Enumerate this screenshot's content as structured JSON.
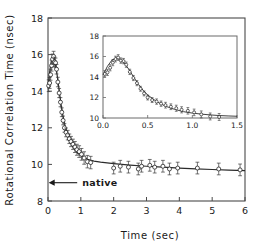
{
  "figure": {
    "background_color": "#ffffff",
    "axis_color": "#4a4a4a",
    "data_color": "#242424",
    "curve_color": "#2b2b2b"
  },
  "chart_data": {
    "type": "scatter",
    "title": "",
    "xlabel": "Time (sec)",
    "ylabel": "Rotational Correlation Time (nsec)",
    "xlim": [
      0,
      6
    ],
    "ylim": [
      8,
      18
    ],
    "xticks": [
      0,
      1,
      2,
      3,
      4,
      5,
      6
    ],
    "yticks": [
      8,
      10,
      12,
      14,
      16,
      18
    ],
    "xtick_labels": [
      "0",
      "1",
      "2",
      "3",
      "4",
      "5",
      "6"
    ],
    "ytick_labels": [
      "8",
      "10",
      "12",
      "14",
      "16",
      "18"
    ],
    "grid": false,
    "legend": "none",
    "annotations": [
      {
        "text": "native",
        "x": 0.95,
        "y": 9.0,
        "arrow_to_x": 0.02,
        "arrow_to_y": 9.0,
        "style": "left-arrow"
      }
    ],
    "series": [
      {
        "name": "Rotational correlation time",
        "marker": "open-circle",
        "errorbars": true,
        "x": [
          0.02,
          0.05,
          0.08,
          0.11,
          0.14,
          0.17,
          0.2,
          0.23,
          0.26,
          0.3,
          0.34,
          0.38,
          0.42,
          0.46,
          0.5,
          0.55,
          0.6,
          0.65,
          0.7,
          0.76,
          0.82,
          0.88,
          0.95,
          1.02,
          1.1,
          1.2,
          1.3,
          2.0,
          2.2,
          2.45,
          2.75,
          2.85,
          3.1,
          3.25,
          3.5,
          3.7,
          3.95,
          4.55,
          5.2,
          5.85
        ],
        "y": [
          14.3,
          14.45,
          14.9,
          15.4,
          15.75,
          15.9,
          15.6,
          15.55,
          15.2,
          14.5,
          13.9,
          13.4,
          12.85,
          12.4,
          12.0,
          11.75,
          11.6,
          11.4,
          11.25,
          11.1,
          10.95,
          10.8,
          10.7,
          10.55,
          10.35,
          10.15,
          10.1,
          9.8,
          9.9,
          9.85,
          9.75,
          9.9,
          9.95,
          9.85,
          9.9,
          9.75,
          9.8,
          9.8,
          9.75,
          9.7
        ],
        "yerr": [
          0.32,
          0.3,
          0.3,
          0.3,
          0.28,
          0.28,
          0.26,
          0.26,
          0.26,
          0.26,
          0.25,
          0.25,
          0.24,
          0.24,
          0.24,
          0.24,
          0.26,
          0.26,
          0.28,
          0.28,
          0.3,
          0.3,
          0.32,
          0.32,
          0.34,
          0.34,
          0.34,
          0.32,
          0.32,
          0.32,
          0.32,
          0.32,
          0.32,
          0.32,
          0.32,
          0.32,
          0.32,
          0.32,
          0.32,
          0.32
        ]
      }
    ],
    "fit_curve": {
      "name": "model fit",
      "x": [
        0.0,
        0.05,
        0.1,
        0.15,
        0.2,
        0.25,
        0.3,
        0.35,
        0.4,
        0.45,
        0.5,
        0.6,
        0.7,
        0.8,
        0.9,
        1.0,
        1.2,
        1.4,
        1.6,
        1.8,
        2.0,
        2.5,
        3.0,
        3.5,
        4.0,
        4.5,
        5.0,
        5.5,
        6.0
      ],
      "y": [
        14.2,
        15.05,
        15.65,
        15.85,
        15.7,
        15.25,
        14.6,
        13.9,
        13.25,
        12.7,
        12.25,
        11.6,
        11.15,
        10.85,
        10.62,
        10.48,
        10.28,
        10.18,
        10.12,
        10.08,
        10.04,
        9.96,
        9.9,
        9.85,
        9.8,
        9.76,
        9.72,
        9.69,
        9.66
      ]
    },
    "inset": {
      "type": "scatter",
      "xlabel": "",
      "ylabel": "",
      "xlim": [
        0.0,
        1.5
      ],
      "ylim": [
        10,
        18
      ],
      "xticks": [
        0.0,
        0.5,
        1.0,
        1.5
      ],
      "yticks": [
        10,
        12,
        14,
        16,
        18
      ],
      "xtick_labels": [
        "0.0",
        "0.5",
        "1.0",
        "1.5"
      ],
      "ytick_labels": [
        "10",
        "12",
        "14",
        "16",
        "18"
      ],
      "grid": false,
      "series": [
        {
          "name": "Rotational correlation time (early times)",
          "marker": "open-circle",
          "errorbars": true,
          "x": [
            0.02,
            0.05,
            0.08,
            0.11,
            0.14,
            0.17,
            0.2,
            0.23,
            0.26,
            0.3,
            0.34,
            0.38,
            0.42,
            0.46,
            0.5,
            0.55,
            0.6,
            0.65,
            0.7,
            0.76,
            0.82,
            0.88,
            0.95,
            1.02,
            1.1,
            1.2,
            1.3
          ],
          "y": [
            14.3,
            14.45,
            14.9,
            15.4,
            15.75,
            15.9,
            15.6,
            15.55,
            15.2,
            14.5,
            13.9,
            13.4,
            12.85,
            12.4,
            12.0,
            11.75,
            11.6,
            11.4,
            11.25,
            11.1,
            10.95,
            10.8,
            10.7,
            10.55,
            10.35,
            10.15,
            10.1
          ],
          "yerr": [
            0.32,
            0.3,
            0.3,
            0.3,
            0.28,
            0.28,
            0.26,
            0.26,
            0.26,
            0.26,
            0.25,
            0.25,
            0.24,
            0.24,
            0.24,
            0.24,
            0.26,
            0.26,
            0.28,
            0.28,
            0.3,
            0.3,
            0.32,
            0.32,
            0.34,
            0.34,
            0.34
          ]
        }
      ],
      "fit_curve": {
        "name": "model fit",
        "x": [
          0.0,
          0.05,
          0.1,
          0.15,
          0.2,
          0.25,
          0.3,
          0.35,
          0.4,
          0.45,
          0.5,
          0.6,
          0.7,
          0.8,
          0.9,
          1.0,
          1.1,
          1.2,
          1.3,
          1.4,
          1.5
        ],
        "y": [
          14.2,
          15.05,
          15.65,
          15.85,
          15.7,
          15.25,
          14.6,
          13.9,
          13.25,
          12.7,
          12.25,
          11.6,
          11.15,
          10.85,
          10.62,
          10.48,
          10.38,
          10.3,
          10.24,
          10.2,
          10.17
        ]
      }
    }
  }
}
